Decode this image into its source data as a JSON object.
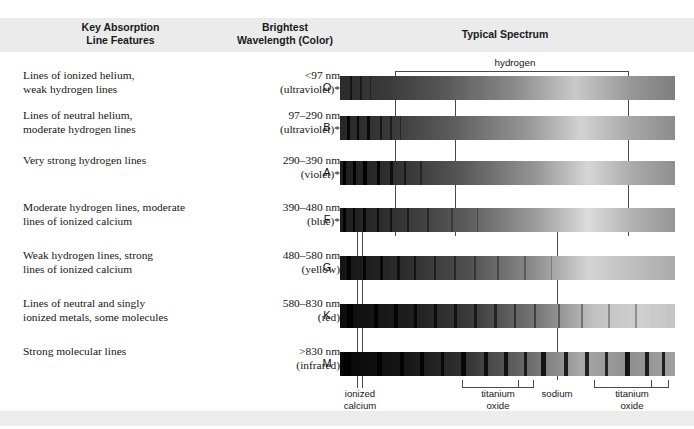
{
  "header": {
    "col1_line1": "Key Absorption",
    "col1_line2": "Line Features",
    "col2_line1": "Brightest",
    "col2_line2": "Wavelength (Color)",
    "col3": "Typical Spectrum"
  },
  "hydrogen_label": "hydrogen",
  "rows": [
    {
      "class": "O",
      "desc_line1": "Lines of ionized helium,",
      "desc_line2": "weak hydrogen lines",
      "wave_line1": "<97 nm",
      "wave_line2": "(ultraviolet)*"
    },
    {
      "class": "B",
      "desc_line1": "Lines of neutral helium,",
      "desc_line2": "moderate hydrogen lines",
      "wave_line1": "97–290 nm",
      "wave_line2": "(ultraviolet)*"
    },
    {
      "class": "A",
      "desc_line1": "Very strong hydrogen lines",
      "desc_line2": "",
      "wave_line1": "290–390 nm",
      "wave_line2": "(violet)*"
    },
    {
      "class": "F",
      "desc_line1": "Moderate hydrogen lines, moderate",
      "desc_line2": "lines of ionized calcium",
      "wave_line1": "390–480 nm",
      "wave_line2": "(blue)*"
    },
    {
      "class": "G",
      "desc_line1": "Weak hydrogen lines, strong",
      "desc_line2": "lines of ionized calcium",
      "wave_line1": "480–580 nm",
      "wave_line2": "(yellow)"
    },
    {
      "class": "K",
      "desc_line1": "Lines of neutral and singly",
      "desc_line2": "ionized metals, some molecules",
      "wave_line1": "580–830 nm",
      "wave_line2": "(red)"
    },
    {
      "class": "M",
      "desc_line1": "Strong molecular lines",
      "desc_line2": "",
      "wave_line1": ">830 nm",
      "wave_line2": "(infrared)"
    }
  ],
  "annotations": [
    {
      "line1": "ionized",
      "line2": "calcium"
    },
    {
      "line1": "titanium",
      "line2": "oxide"
    },
    {
      "line1": "sodium",
      "line2": ""
    },
    {
      "line1": "titanium",
      "line2": "oxide"
    }
  ],
  "colors": {
    "band": "#ebebeb",
    "rule": "#4a4a4a",
    "text": "#161616"
  }
}
